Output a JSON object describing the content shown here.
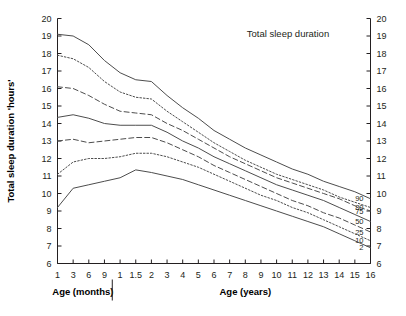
{
  "chart_data": {
    "type": "line",
    "title": "Total sleep duration",
    "xlabel": "",
    "ylabel": "Total sleep duration 'hours'",
    "xlabel_left": "Age (months)",
    "xlabel_right": "Age (years)",
    "ylim": [
      6,
      20
    ],
    "y_ticks": [
      6,
      7,
      8,
      9,
      10,
      11,
      12,
      13,
      14,
      15,
      16,
      17,
      18,
      19,
      20
    ],
    "y_ticks_right": [
      6,
      7,
      8,
      9,
      10,
      11,
      12,
      13,
      14,
      15,
      16,
      17,
      18,
      19,
      20
    ],
    "grid": false,
    "legend_position": "right-inline",
    "x_tick_labels": [
      "1",
      "3",
      "6",
      "9",
      "1",
      "1.5",
      "2",
      "3",
      "4",
      "5",
      "6",
      "7",
      "8",
      "9",
      "10",
      "11",
      "12",
      "13",
      "14",
      "15",
      "16"
    ],
    "x_units": [
      "months",
      "months",
      "months",
      "months",
      "years",
      "years",
      "years",
      "years",
      "years",
      "years",
      "years",
      "years",
      "years",
      "years",
      "years",
      "years",
      "years",
      "years",
      "years",
      "years",
      "years"
    ],
    "x_index": [
      0,
      1,
      2,
      3,
      4,
      5,
      6,
      7,
      8,
      9,
      10,
      11,
      12,
      13,
      14,
      15,
      16,
      17,
      18,
      19,
      20
    ],
    "months_years_split_after_index": 3,
    "series": [
      {
        "name": "90",
        "label": "90",
        "style": "solid",
        "values": [
          19.1,
          19.0,
          18.5,
          17.6,
          16.9,
          16.5,
          16.4,
          15.6,
          14.9,
          14.3,
          13.6,
          13.1,
          12.6,
          12.2,
          11.8,
          11.4,
          11.1,
          10.7,
          10.4,
          10.1,
          9.7
        ]
      },
      {
        "name": "80",
        "label": "80",
        "style": "dotted",
        "values": [
          17.9,
          17.7,
          17.2,
          16.4,
          15.8,
          15.5,
          15.4,
          14.7,
          14.1,
          13.5,
          12.9,
          12.4,
          11.9,
          11.5,
          11.1,
          10.8,
          10.5,
          10.2,
          9.8,
          9.5,
          9.2
        ]
      },
      {
        "name": "75",
        "label": "75",
        "style": "dashed",
        "values": [
          16.1,
          16.0,
          15.6,
          15.1,
          14.7,
          14.6,
          14.5,
          14.0,
          13.6,
          13.1,
          12.6,
          12.1,
          11.7,
          11.3,
          10.9,
          10.6,
          10.3,
          10.0,
          9.7,
          9.3,
          9.0
        ]
      },
      {
        "name": "50",
        "label": "50",
        "style": "solid",
        "values": [
          14.35,
          14.5,
          14.3,
          14.0,
          13.9,
          13.9,
          13.9,
          13.5,
          13.0,
          12.6,
          12.1,
          11.7,
          11.3,
          10.9,
          10.5,
          10.2,
          9.9,
          9.6,
          9.2,
          8.8,
          8.4
        ]
      },
      {
        "name": "25",
        "label": "25",
        "style": "dashed",
        "values": [
          13.0,
          13.1,
          12.9,
          13.0,
          13.1,
          13.2,
          13.2,
          12.9,
          12.5,
          12.1,
          11.6,
          11.2,
          10.8,
          10.4,
          10.0,
          9.6,
          9.3,
          8.9,
          8.6,
          8.2,
          7.8
        ]
      },
      {
        "name": "10",
        "label": "10",
        "style": "dotted",
        "values": [
          11.1,
          11.8,
          12.0,
          12.0,
          12.1,
          12.3,
          12.3,
          12.1,
          11.8,
          11.5,
          11.1,
          10.7,
          10.3,
          9.9,
          9.6,
          9.2,
          8.9,
          8.5,
          8.1,
          7.7,
          7.3
        ]
      },
      {
        "name": "2",
        "label": "2",
        "style": "solid",
        "values": [
          9.2,
          10.3,
          10.5,
          10.7,
          10.9,
          11.35,
          11.2,
          11.0,
          10.8,
          10.5,
          10.2,
          9.9,
          9.6,
          9.3,
          9.0,
          8.7,
          8.4,
          8.1,
          7.7,
          7.3,
          6.9
        ]
      }
    ]
  }
}
